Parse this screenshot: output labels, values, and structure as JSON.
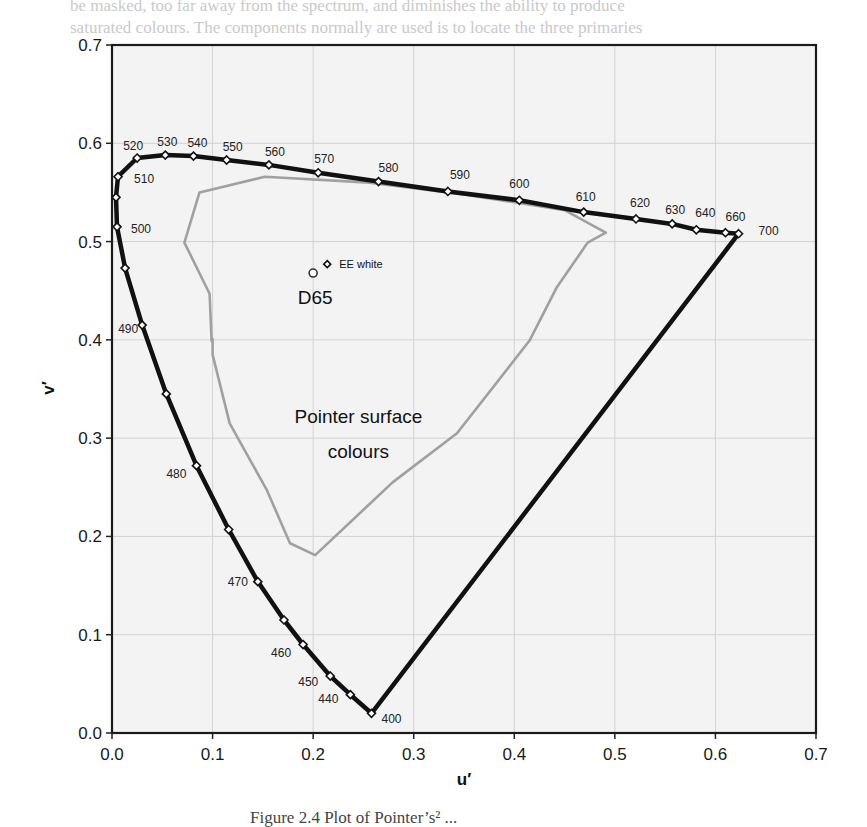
{
  "page": {
    "bleed_text_1": "be masked, too far away from the spectrum, and diminishes the ability to produce",
    "bleed_text_2": "saturated colours. The components normally are used is to locate the three primaries",
    "caption": "Figure 2.4   Plot of Pointer’s² ..."
  },
  "chart_data": {
    "type": "line",
    "title": "",
    "xlabel": "u′",
    "ylabel": "v′",
    "xlim": [
      0.0,
      0.7
    ],
    "ylim": [
      0.0,
      0.7
    ],
    "grid": true,
    "xticks": [
      "0.0",
      "0.1",
      "0.2",
      "0.3",
      "0.4",
      "0.5",
      "0.6",
      "0.7"
    ],
    "yticks": [
      "0.0",
      "0.1",
      "0.2",
      "0.3",
      "0.4",
      "0.5",
      "0.6",
      "0.7"
    ],
    "series": [
      {
        "name": "Spectral locus",
        "color": "#111111",
        "marker": "diamond",
        "points": [
          {
            "wl": "400",
            "u": 0.258,
            "v": 0.02,
            "label": true
          },
          {
            "wl": "440",
            "u": 0.237,
            "v": 0.039,
            "label": true
          },
          {
            "wl": "450",
            "u": 0.217,
            "v": 0.058,
            "label": true
          },
          {
            "wl": "460",
            "u": 0.19,
            "v": 0.09,
            "label": true
          },
          {
            "wl": "465",
            "u": 0.171,
            "v": 0.115,
            "label": false
          },
          {
            "wl": "470",
            "u": 0.145,
            "v": 0.154,
            "label": true
          },
          {
            "wl": "475",
            "u": 0.116,
            "v": 0.207,
            "label": false
          },
          {
            "wl": "480",
            "u": 0.084,
            "v": 0.272,
            "label": true
          },
          {
            "wl": "485",
            "u": 0.054,
            "v": 0.345,
            "label": false
          },
          {
            "wl": "490",
            "u": 0.03,
            "v": 0.415,
            "label": true
          },
          {
            "wl": "495",
            "u": 0.013,
            "v": 0.473,
            "label": false
          },
          {
            "wl": "500",
            "u": 0.005,
            "v": 0.515,
            "label": true
          },
          {
            "wl": "505",
            "u": 0.004,
            "v": 0.545,
            "label": false
          },
          {
            "wl": "510",
            "u": 0.006,
            "v": 0.566,
            "label": true
          },
          {
            "wl": "520",
            "u": 0.025,
            "v": 0.585,
            "label": true
          },
          {
            "wl": "530",
            "u": 0.053,
            "v": 0.588,
            "label": true
          },
          {
            "wl": "540",
            "u": 0.081,
            "v": 0.587,
            "label": true
          },
          {
            "wl": "550",
            "u": 0.114,
            "v": 0.583,
            "label": true
          },
          {
            "wl": "560",
            "u": 0.156,
            "v": 0.578,
            "label": true
          },
          {
            "wl": "570",
            "u": 0.205,
            "v": 0.57,
            "label": true
          },
          {
            "wl": "580",
            "u": 0.265,
            "v": 0.561,
            "label": true
          },
          {
            "wl": "590",
            "u": 0.334,
            "v": 0.551,
            "label": true
          },
          {
            "wl": "600",
            "u": 0.405,
            "v": 0.542,
            "label": true
          },
          {
            "wl": "610",
            "u": 0.469,
            "v": 0.53,
            "label": true
          },
          {
            "wl": "620",
            "u": 0.521,
            "v": 0.523,
            "label": true
          },
          {
            "wl": "630",
            "u": 0.557,
            "v": 0.518,
            "label": true
          },
          {
            "wl": "640",
            "u": 0.581,
            "v": 0.512,
            "label": true
          },
          {
            "wl": "660",
            "u": 0.61,
            "v": 0.509,
            "label": true
          },
          {
            "wl": "700",
            "u": 0.623,
            "v": 0.508,
            "label": true
          }
        ],
        "closed_by_purple_line": true
      },
      {
        "name": "Pointer surface colours",
        "color": "#a0a0a0",
        "closed": true,
        "points": [
          {
            "u": 0.087,
            "v": 0.55
          },
          {
            "u": 0.152,
            "v": 0.566
          },
          {
            "u": 0.256,
            "v": 0.56
          },
          {
            "u": 0.35,
            "v": 0.548
          },
          {
            "u": 0.45,
            "v": 0.532
          },
          {
            "u": 0.491,
            "v": 0.509
          },
          {
            "u": 0.473,
            "v": 0.499
          },
          {
            "u": 0.442,
            "v": 0.453
          },
          {
            "u": 0.415,
            "v": 0.399
          },
          {
            "u": 0.343,
            "v": 0.305
          },
          {
            "u": 0.279,
            "v": 0.255
          },
          {
            "u": 0.202,
            "v": 0.181
          },
          {
            "u": 0.177,
            "v": 0.193
          },
          {
            "u": 0.154,
            "v": 0.247
          },
          {
            "u": 0.117,
            "v": 0.315
          },
          {
            "u": 0.1,
            "v": 0.385
          },
          {
            "u": 0.1,
            "v": 0.401
          },
          {
            "u": 0.099,
            "v": 0.399
          },
          {
            "u": 0.097,
            "v": 0.447
          },
          {
            "u": 0.072,
            "v": 0.499
          }
        ]
      }
    ],
    "annotations": [
      {
        "text": "D65",
        "u": 0.2,
        "v": 0.468,
        "marker": "circle"
      },
      {
        "text": "EE white",
        "u": 0.214,
        "v": 0.477,
        "marker": "diamond"
      },
      {
        "text": "Pointer surface",
        "u": 0.245,
        "v": 0.315
      },
      {
        "text": "colours",
        "u": 0.245,
        "v": 0.28
      }
    ]
  }
}
